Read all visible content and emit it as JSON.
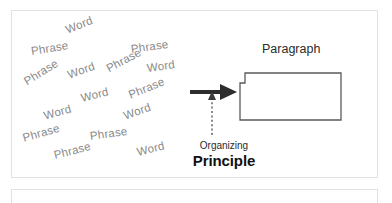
{
  "diagram": {
    "title_concept": "Organizing Principle turns scattered Words and Phrases into a Paragraph",
    "colors": {
      "scatter_text": "#8a8a8a",
      "dark_text": "#111111",
      "arrow": "#2d2d2d",
      "shape_stroke": "#5a5a5a",
      "panel_border": "#e2e2e2",
      "background": "#ffffff"
    },
    "scatter_words": [
      {
        "label": "Word",
        "x": 55,
        "y": 14,
        "rot": -22,
        "size": 11.5
      },
      {
        "label": "Phrase",
        "x": 20,
        "y": 35,
        "rot": -9,
        "size": 11.5
      },
      {
        "label": "Phrase",
        "x": 120,
        "y": 33,
        "rot": -8,
        "size": 11.5
      },
      {
        "label": "Phrase",
        "x": 96,
        "y": 53,
        "rot": -28,
        "size": 11.5
      },
      {
        "label": "Word",
        "x": 136,
        "y": 52,
        "rot": -8,
        "size": 11.5
      },
      {
        "label": "Word",
        "x": 57,
        "y": 59,
        "rot": -20,
        "size": 11.5
      },
      {
        "label": "Phrase",
        "x": 14,
        "y": 66,
        "rot": -32,
        "size": 11.5
      },
      {
        "label": "Word",
        "x": 70,
        "y": 82,
        "rot": -14,
        "size": 11.5
      },
      {
        "label": "Phrase",
        "x": 118,
        "y": 79,
        "rot": -22,
        "size": 11.5
      },
      {
        "label": "Word",
        "x": 33,
        "y": 100,
        "rot": -16,
        "size": 11.5
      },
      {
        "label": "Word",
        "x": 113,
        "y": 100,
        "rot": -20,
        "size": 11.5
      },
      {
        "label": "Phrase",
        "x": 12,
        "y": 122,
        "rot": -16,
        "size": 11.5
      },
      {
        "label": "Phrase",
        "x": 79,
        "y": 120,
        "rot": -8,
        "size": 11.5
      },
      {
        "label": "Phrase",
        "x": 43,
        "y": 139,
        "rot": -14,
        "size": 11.5
      },
      {
        "label": "Word",
        "x": 126,
        "y": 136,
        "rot": -14,
        "size": 11.5
      }
    ],
    "arrow": {
      "name": "transformation-arrow",
      "direction": "right"
    },
    "vertical_connector": {
      "name": "dotted-pointer",
      "style": "dotted",
      "direction": "up"
    },
    "caption": {
      "line1": "Organizing",
      "line2": "Principle"
    },
    "output": {
      "label": "Paragraph",
      "shape": "notched-rectangle"
    }
  }
}
